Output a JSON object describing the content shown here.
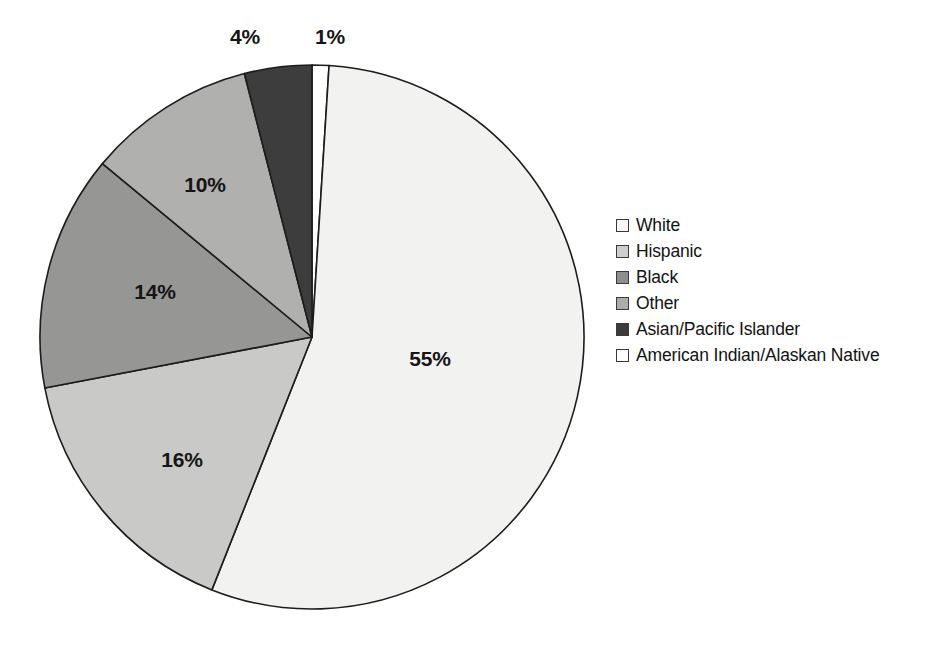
{
  "chart_data": {
    "type": "pie",
    "title": "",
    "subtitle": "",
    "xlabel": "",
    "ylabel": "",
    "grid": false,
    "legend_position": "right",
    "start_angle_deg": 0,
    "direction": "clockwise",
    "categories": [
      "American Indian/Alaskan Native",
      "White",
      "Hispanic",
      "Black",
      "Other",
      "Asian/Pacific Islander"
    ],
    "values": [
      1,
      55,
      16,
      14,
      10,
      4
    ],
    "value_labels": [
      "1%",
      "55%",
      "16%",
      "14%",
      "10%",
      "4%"
    ],
    "units": "percent",
    "slices": [
      {
        "label": "American Indian/Alaskan Native",
        "value": 1,
        "value_label": "1%",
        "color": "#ffffff",
        "start_deg": 0,
        "end_deg": 3.6,
        "label_x": 330,
        "label_y": 38,
        "label_placement": "outside"
      },
      {
        "label": "White",
        "value": 55,
        "value_label": "55%",
        "color": "#f2f2f0",
        "start_deg": 3.6,
        "end_deg": 201.6,
        "label_x": 430,
        "label_y": 360,
        "label_placement": "inside"
      },
      {
        "label": "Hispanic",
        "value": 16,
        "value_label": "16%",
        "color": "#c9c9c7",
        "start_deg": 201.6,
        "end_deg": 259.2,
        "label_x": 182,
        "label_y": 461,
        "label_placement": "inside"
      },
      {
        "label": "Black",
        "value": 14,
        "value_label": "14%",
        "color": "#969694",
        "start_deg": 259.2,
        "end_deg": 309.6,
        "label_x": 155,
        "label_y": 293,
        "label_placement": "inside"
      },
      {
        "label": "Other",
        "value": 10,
        "value_label": "10%",
        "color": "#b0b0ae",
        "start_deg": 309.6,
        "end_deg": 345.6,
        "label_x": 205,
        "label_y": 186,
        "label_placement": "inside"
      },
      {
        "label": "Asian/Pacific Islander",
        "value": 4,
        "value_label": "4%",
        "color": "#3d3d3d",
        "start_deg": 345.6,
        "end_deg": 360,
        "label_x": 245,
        "label_y": 38,
        "label_placement": "outside"
      }
    ],
    "geometry": {
      "center_x": 312,
      "center_y": 337,
      "radius": 272,
      "stroke_color": "#1c1c1c",
      "stroke_width": 1.6
    }
  },
  "legend": {
    "items": [
      {
        "label": "White",
        "color": "#f7f7f5"
      },
      {
        "label": "Hispanic",
        "color": "#cdcdcb"
      },
      {
        "label": "Black",
        "color": "#8e8e8c"
      },
      {
        "label": "Other",
        "color": "#adadab"
      },
      {
        "label": "Asian/Pacific Islander",
        "color": "#3b3b3b"
      },
      {
        "label": "American Indian/Alaskan Native",
        "color": "#ffffff"
      }
    ]
  }
}
